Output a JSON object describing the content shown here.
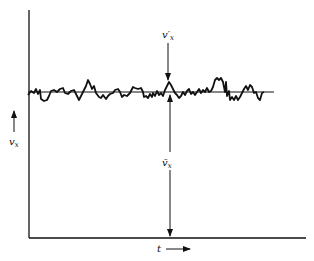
{
  "diagram": {
    "type": "turbulent-velocity-fluctuation",
    "labels": {
      "fluctuation": "v′",
      "fluctuation_sub": "x",
      "mean": "v̄",
      "mean_sub": "x",
      "y_axis": "v",
      "y_axis_sub": "x",
      "x_axis": "t"
    },
    "colors": {
      "ink": "#111111",
      "background": "#ffffff"
    }
  }
}
